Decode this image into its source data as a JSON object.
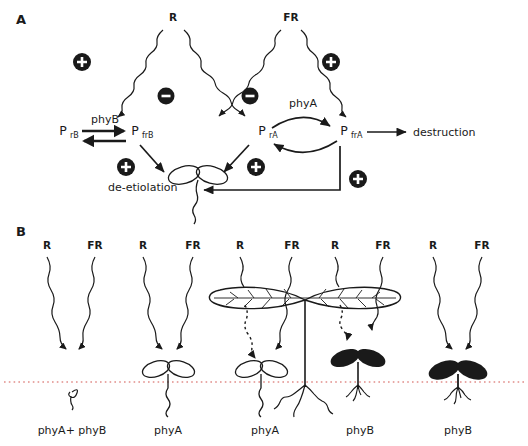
{
  "figure": {
    "background": "#ffffff",
    "ink": "#1a1a1a",
    "soil_line_color": "#d2544f"
  },
  "panels": [
    {
      "id": "A",
      "letter": "A",
      "light_sources": [
        {
          "name": "R",
          "label": "R"
        },
        {
          "name": "FR",
          "label": "FR"
        }
      ],
      "pools": [
        {
          "name": "PrB",
          "base": "P",
          "sub": "rB"
        },
        {
          "name": "PfrB",
          "base": "P",
          "sub": "frB"
        },
        {
          "name": "PrA",
          "base": "P",
          "sub": "rA"
        },
        {
          "name": "PfrA",
          "base": "P",
          "sub": "frA"
        }
      ],
      "enzyme_labels": [
        {
          "name": "phyB",
          "label": "phyB"
        },
        {
          "name": "phyA",
          "label": "phyA"
        }
      ],
      "outcomes": [
        {
          "name": "destruction",
          "label": "destruction"
        },
        {
          "name": "de-etiolation",
          "label": "de-etiolation"
        }
      ],
      "signs": [
        {
          "name": "plus-R-to-PrB",
          "symbol": "+"
        },
        {
          "name": "minus-R-to-PfrB",
          "symbol": "−"
        },
        {
          "name": "minus-FR-to-PrA",
          "symbol": "−"
        },
        {
          "name": "plus-FR-to-PfrA",
          "symbol": "+"
        },
        {
          "name": "plus-PfrB-deetiolation",
          "symbol": "+"
        },
        {
          "name": "plus-PrA-deetiolation",
          "symbol": "+"
        },
        {
          "name": "plus-PfrA-deetiolation",
          "symbol": "+"
        }
      ]
    },
    {
      "id": "B",
      "letter": "B",
      "columns": [
        {
          "name": "col-1",
          "r_label": "R",
          "fr_label": "FR",
          "genotype": "phyA+ phyB",
          "seedling": "etiolated-hook"
        },
        {
          "name": "col-2",
          "r_label": "R",
          "fr_label": "FR",
          "genotype": "phyA",
          "seedling": "open-white-cotyledons"
        },
        {
          "name": "col-3",
          "r_label": "R",
          "fr_label": "FR",
          "genotype": "phyA",
          "seedling": "open-white-cotyledons-shaded"
        },
        {
          "name": "col-4",
          "r_label": "R",
          "fr_label": "FR",
          "genotype": "phyB",
          "seedling": "green-cotyledons-shaded"
        },
        {
          "name": "col-5",
          "r_label": "R",
          "fr_label": "FR",
          "genotype": "phyB",
          "seedling": "green-cotyledons"
        }
      ]
    }
  ]
}
